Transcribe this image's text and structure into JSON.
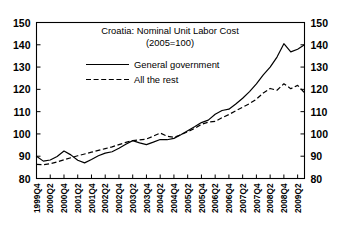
{
  "chart_data": {
    "type": "line",
    "title": "Croatia: Nominal Unit Labor Cost",
    "subtitle": "(2005=100)",
    "xlabel": "",
    "ylabel": "",
    "ylim": [
      80,
      150
    ],
    "yticks": [
      80,
      90,
      100,
      110,
      120,
      130,
      140,
      150
    ],
    "ytick_labels": [
      "80",
      "90",
      "100",
      "110",
      "120",
      "130",
      "140",
      "150"
    ],
    "grid": false,
    "legend_position": "top-center",
    "dual_y_axis": true,
    "x": [
      "1999Q4",
      "2000Q1",
      "2000Q2",
      "2000Q3",
      "2000Q4",
      "2001Q1",
      "2001Q2",
      "2001Q3",
      "2001Q4",
      "2002Q1",
      "2002Q2",
      "2002Q3",
      "2002Q4",
      "2003Q1",
      "2003Q2",
      "2003Q3",
      "2003Q4",
      "2004Q1",
      "2004Q2",
      "2004Q3",
      "2004Q4",
      "2005Q1",
      "2005Q2",
      "2005Q3",
      "2005Q4",
      "2006Q1",
      "2006Q2",
      "2006Q3",
      "2006Q4",
      "2007Q1",
      "2007Q2",
      "2007Q3",
      "2007Q4",
      "2008Q1",
      "2008Q2",
      "2008Q3",
      "2008Q4",
      "2009Q1",
      "2009Q2",
      "2009Q3"
    ],
    "xtick_labels": [
      "1999Q4",
      "2000Q2",
      "2000Q4",
      "2001Q2",
      "2001Q4",
      "2002Q2",
      "2002Q4",
      "2003Q2",
      "2003Q4",
      "2004Q2",
      "2004Q4",
      "2005Q2",
      "2005Q4",
      "2006Q2",
      "2006Q4",
      "2007Q2",
      "2007Q4",
      "2008Q2",
      "2008Q4",
      "2009Q2"
    ],
    "series": [
      {
        "name": "General government",
        "style": "solid",
        "values": [
          90.0,
          87.8,
          88.3,
          89.9,
          92.3,
          90.6,
          88.2,
          87.0,
          88.5,
          90.2,
          91.4,
          92.0,
          93.6,
          95.4,
          97.0,
          96.0,
          95.2,
          96.3,
          97.5,
          97.4,
          98.0,
          99.6,
          101.4,
          103.2,
          105.1,
          106.2,
          108.8,
          110.5,
          111.1,
          113.4,
          116.0,
          119.0,
          122.5,
          126.5,
          130.0,
          134.5,
          140.5,
          136.8,
          138.0,
          140.0
        ]
      },
      {
        "name": "All the rest",
        "style": "dashed",
        "values": [
          86.3,
          86.2,
          86.6,
          87.4,
          88.4,
          89.3,
          90.2,
          91.0,
          91.8,
          92.6,
          93.4,
          94.2,
          95.2,
          96.2,
          97.0,
          97.3,
          97.7,
          99.0,
          100.4,
          99.0,
          98.5,
          99.6,
          101.0,
          102.5,
          104.3,
          105.3,
          105.6,
          107.3,
          108.7,
          110.4,
          112.0,
          113.6,
          115.6,
          118.4,
          120.4,
          119.6,
          122.5,
          120.3,
          121.8,
          118.5
        ]
      }
    ]
  },
  "legend": {
    "entries": [
      {
        "label": "General government",
        "style": "solid"
      },
      {
        "label": "All the rest",
        "style": "dashed"
      }
    ]
  }
}
